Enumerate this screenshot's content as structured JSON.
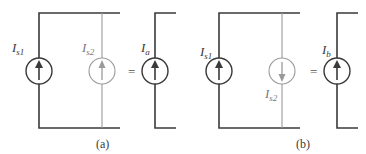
{
  "colors": {
    "wire_dark": "#3a3a3a",
    "wire_light": "#9a9a9a",
    "background": "#ffffff"
  },
  "panels": [
    {
      "caption": "(a)",
      "sources": [
        {
          "label_main": "I",
          "label_sub": "s1",
          "direction": "up",
          "style": "dark"
        },
        {
          "label_main": "I",
          "label_sub": "s2",
          "direction": "up",
          "style": "light"
        },
        {
          "label_main": "I",
          "label_sub": "a",
          "direction": "up",
          "style": "dark",
          "equivalent": true
        }
      ],
      "equals": "="
    },
    {
      "caption": "(b)",
      "sources": [
        {
          "label_main": "I",
          "label_sub": "s1",
          "direction": "up",
          "style": "dark"
        },
        {
          "label_main": "I",
          "label_sub": "s2",
          "direction": "down",
          "style": "light"
        },
        {
          "label_main": "I",
          "label_sub": "b",
          "direction": "up",
          "style": "dark",
          "equivalent": true
        }
      ],
      "equals": "="
    }
  ]
}
